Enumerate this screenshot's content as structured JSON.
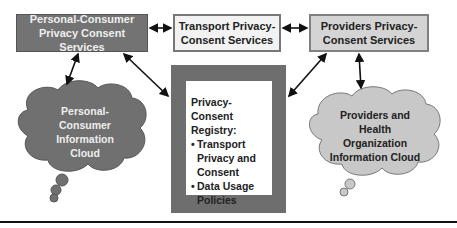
{
  "diagram": {
    "nodes": {
      "personal_consumer_services": {
        "line1": "Personal-Consumer",
        "line2": "Privacy Consent Services"
      },
      "transport_services": {
        "line1": "Transport Privacy-",
        "line2": "Consent Services"
      },
      "providers_services": {
        "line1": "Providers Privacy-",
        "line2": "Consent Services"
      },
      "registry": {
        "title_line1": "Privacy-Consent",
        "title_line2": "Registry:",
        "bullet_char": "•",
        "bullets": [
          {
            "line1": "Transport",
            "line2": "Privacy and",
            "line3": "Consent"
          },
          {
            "line1": "Data Usage",
            "line2": "Policies"
          }
        ]
      },
      "personal_cloud": {
        "line1": "Personal-",
        "line2": "Consumer",
        "line3": "Information",
        "line4": "Cloud"
      },
      "providers_cloud": {
        "line1": "Providers and",
        "line2": "Health",
        "line3": "Organization",
        "line4": "Information Cloud"
      }
    },
    "edges": [
      {
        "from": "personal_consumer_services",
        "to": "transport_services",
        "type": "bidirectional"
      },
      {
        "from": "transport_services",
        "to": "providers_services",
        "type": "bidirectional"
      },
      {
        "from": "personal_consumer_services",
        "to": "personal_cloud",
        "type": "bidirectional"
      },
      {
        "from": "personal_consumer_services",
        "to": "registry",
        "type": "bidirectional"
      },
      {
        "from": "providers_services",
        "to": "registry",
        "type": "bidirectional"
      },
      {
        "from": "providers_services",
        "to": "providers_cloud",
        "type": "bidirectional"
      }
    ],
    "colors": {
      "dark_box": "#737373",
      "light_box": "#f2f2f2",
      "mid_box": "#d4d4d4",
      "registry_frame": "#6e6e6e",
      "dark_cloud": "#707070",
      "light_cloud": "#c8c8c8"
    }
  }
}
